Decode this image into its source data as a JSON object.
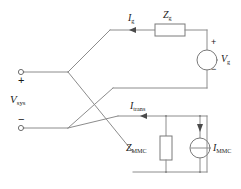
{
  "diagram": {
    "type": "electrical-schematic",
    "colors": {
      "wire": "#8c8c8c",
      "component_outline": "#7a7a7a",
      "text": "#1a1a1a",
      "background": "#ffffff"
    },
    "labels": {
      "v_sys": {
        "symbol": "V",
        "subscript": "sys",
        "text": "Vsys"
      },
      "i_g": {
        "symbol": "I",
        "subscript": "g",
        "text": "Ig"
      },
      "z_g": {
        "symbol": "Z",
        "subscript": "g",
        "text": "Zg"
      },
      "v_g": {
        "symbol": "V",
        "subscript": "g",
        "text": "Vg"
      },
      "i_trans": {
        "symbol": "I",
        "subscript": "trans",
        "text": "Itrans"
      },
      "z_mmc": {
        "symbol": "Z",
        "subscript": "MMC",
        "text": "ZMMC"
      },
      "i_mmc": {
        "symbol": "I",
        "subscript": "MMC",
        "text": "IMMC"
      }
    },
    "polarity": {
      "sys_plus": "+",
      "sys_minus": "−",
      "vg_plus": "+",
      "vg_minus": "−"
    },
    "components": [
      {
        "name": "grid-impedance",
        "kind": "resistor",
        "label": "Zg",
        "orientation": "horizontal"
      },
      {
        "name": "grid-voltage-source",
        "kind": "voltage-source",
        "label": "Vg",
        "orientation": "vertical"
      },
      {
        "name": "mmc-impedance",
        "kind": "resistor",
        "label": "ZMMC",
        "orientation": "vertical"
      },
      {
        "name": "mmc-current-source",
        "kind": "current-source",
        "label": "IMMC",
        "orientation": "vertical"
      }
    ],
    "terminals": [
      {
        "name": "system-positive-terminal",
        "polarity": "+"
      },
      {
        "name": "system-negative-terminal",
        "polarity": "−"
      }
    ],
    "currents": [
      {
        "name": "grid-current",
        "label": "Ig",
        "direction": "right"
      },
      {
        "name": "transformer-current",
        "label": "Itrans",
        "direction": "right"
      },
      {
        "name": "mmc-source-current",
        "label": "IMMC",
        "direction": "down"
      }
    ]
  }
}
